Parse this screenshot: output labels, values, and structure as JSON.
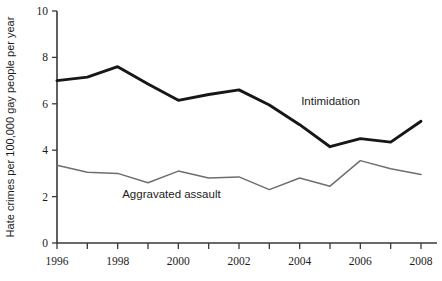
{
  "chart_data": {
    "type": "line",
    "title": "",
    "xlabel": "",
    "ylabel": "Hate crimes per 100,000 gay people per year",
    "xlim": [
      1996,
      2008
    ],
    "ylim": [
      0,
      10
    ],
    "grid": false,
    "legend_position": "inline-annotation",
    "x": [
      1996,
      1997,
      1998,
      1999,
      2000,
      2001,
      2002,
      2003,
      2004,
      2005,
      2006,
      2007,
      2008
    ],
    "xtick_values": [
      1996,
      1997,
      1998,
      1999,
      2000,
      2001,
      2002,
      2003,
      2004,
      2005,
      2006,
      2007,
      2008
    ],
    "xtick_labels": [
      "1996",
      "",
      "1998",
      "",
      "2000",
      "",
      "2002",
      "",
      "2004",
      "",
      "2006",
      "",
      "2008"
    ],
    "ytick_values": [
      0,
      2,
      4,
      6,
      8,
      10
    ],
    "ytick_labels": [
      "0",
      "2",
      "4",
      "6",
      "8",
      "10"
    ],
    "series": [
      {
        "name": "Intimidation",
        "color": "#171717",
        "linewidth": 2.9,
        "annotation": "Intimidation",
        "annotation_x": 2004.05,
        "annotation_y": 5.95,
        "values": [
          7.0,
          7.15,
          7.6,
          6.85,
          6.15,
          6.4,
          6.6,
          5.95,
          5.1,
          4.15,
          4.5,
          4.35,
          5.25
        ]
      },
      {
        "name": "Aggravated assault",
        "color": "#6e6e6e",
        "linewidth": 1.5,
        "annotation": "Aggravated assault",
        "annotation_x": 1998.15,
        "annotation_y": 1.95,
        "values": [
          3.35,
          3.05,
          3.0,
          2.6,
          3.1,
          2.8,
          2.85,
          2.3,
          2.8,
          2.45,
          3.55,
          3.2,
          2.95
        ]
      }
    ]
  }
}
